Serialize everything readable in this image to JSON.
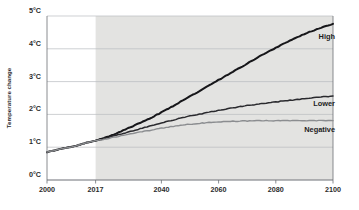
{
  "chart_data": {
    "type": "line",
    "title": "",
    "subtitle": "",
    "xlabel": "",
    "ylabel": "Temperature change",
    "xlim": [
      2000,
      2100
    ],
    "ylim": [
      0,
      5
    ],
    "grid": true,
    "legend_position": "inline-right-end-labels",
    "y_tick_labels": [
      "0°C",
      "1°C",
      "2°C",
      "3°C",
      "4°C",
      "5°C"
    ],
    "y_tick_values": [
      0,
      1,
      2,
      3,
      4,
      5
    ],
    "x_tick_labels": [
      "2000",
      "2017",
      "2040",
      "2060",
      "2080",
      "2100"
    ],
    "x_tick_values": [
      2000,
      2017,
      2040,
      2060,
      2080,
      2100
    ],
    "shaded_region": {
      "label": "projection",
      "x_start": 2017,
      "x_end": 2100,
      "color": "#e3e3e1"
    },
    "x": [
      2000,
      2002,
      2004,
      2006,
      2008,
      2010,
      2012,
      2014,
      2017,
      2020,
      2025,
      2030,
      2035,
      2040,
      2045,
      2050,
      2055,
      2060,
      2065,
      2070,
      2075,
      2080,
      2085,
      2090,
      2095,
      2100
    ],
    "series": [
      {
        "name": "High",
        "label": "High",
        "color": "#17171a",
        "width": 2.0,
        "values": [
          0.85,
          0.89,
          0.93,
          0.97,
          1.0,
          1.04,
          1.09,
          1.14,
          1.2,
          1.28,
          1.45,
          1.64,
          1.84,
          2.06,
          2.3,
          2.55,
          2.8,
          3.05,
          3.3,
          3.55,
          3.8,
          4.03,
          4.25,
          4.45,
          4.62,
          4.76
        ],
        "end_value": 4.76
      },
      {
        "name": "Lower",
        "label": "Lower",
        "color": "#2a2a2e",
        "width": 1.5,
        "values": [
          0.85,
          0.89,
          0.93,
          0.97,
          1.0,
          1.04,
          1.09,
          1.14,
          1.2,
          1.26,
          1.38,
          1.5,
          1.62,
          1.74,
          1.85,
          1.95,
          2.04,
          2.12,
          2.2,
          2.27,
          2.33,
          2.38,
          2.43,
          2.48,
          2.52,
          2.56
        ],
        "end_value": 2.56
      },
      {
        "name": "Negative",
        "label": "Negative",
        "color": "#8b8d90",
        "width": 1.4,
        "values": [
          0.85,
          0.89,
          0.93,
          0.97,
          1.0,
          1.04,
          1.09,
          1.14,
          1.2,
          1.24,
          1.33,
          1.42,
          1.5,
          1.58,
          1.65,
          1.7,
          1.74,
          1.77,
          1.79,
          1.8,
          1.81,
          1.81,
          1.81,
          1.81,
          1.81,
          1.81
        ],
        "end_value": 1.81
      }
    ]
  },
  "colors": {
    "background": "#ffffff",
    "grid": "#b9bcc0",
    "axis": "#6c7075",
    "shade": "#e3e3e1",
    "text": "#2b2b2b"
  }
}
